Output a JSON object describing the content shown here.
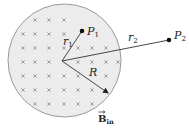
{
  "diagram": {
    "title": "",
    "colors": {
      "region_fill": "#ececec",
      "region_stroke": "#9a9a9a",
      "cross": "#8a8a8a",
      "line": "#333333",
      "point": "#111111"
    },
    "region": {
      "shape": "circle",
      "label": "uniform magnetic field into page",
      "cx": 64.5,
      "cy": 60.5,
      "r": 56.5
    },
    "field": {
      "symbol": "B",
      "subscript": "in",
      "vector": true,
      "marker": "×",
      "crosses": [
        [
          35,
          20
        ],
        [
          49,
          20
        ],
        [
          64,
          20
        ],
        [
          23,
          34
        ],
        [
          35,
          34
        ],
        [
          49,
          34
        ],
        [
          64,
          34
        ],
        [
          23,
          48
        ],
        [
          35,
          48
        ],
        [
          49,
          48
        ],
        [
          64,
          48
        ],
        [
          78,
          48
        ],
        [
          92,
          48
        ],
        [
          106,
          48
        ],
        [
          23,
          62
        ],
        [
          35,
          62
        ],
        [
          49,
          62
        ],
        [
          78,
          62
        ],
        [
          92,
          62
        ],
        [
          106,
          62
        ],
        [
          118,
          62
        ],
        [
          23,
          76
        ],
        [
          35,
          76
        ],
        [
          49,
          76
        ],
        [
          64,
          76
        ],
        [
          78,
          76
        ],
        [
          106,
          76
        ],
        [
          23,
          90
        ],
        [
          35,
          90
        ],
        [
          49,
          90
        ],
        [
          64,
          90
        ],
        [
          78,
          90
        ],
        [
          92,
          90
        ],
        [
          35,
          104
        ],
        [
          49,
          104
        ],
        [
          64,
          104
        ],
        [
          78,
          104
        ],
        [
          92,
          104
        ]
      ]
    },
    "points": [
      {
        "id": "P1",
        "label": "P",
        "subscript": "1",
        "x": 82,
        "y": 31,
        "label_x": 87,
        "label_y": 35
      },
      {
        "id": "P2",
        "label": "P",
        "subscript": "2",
        "x": 169,
        "y": 40,
        "label_x": 174,
        "label_y": 39
      }
    ],
    "segments": [
      {
        "id": "r1",
        "label": "r",
        "subscript": "1",
        "from": [
          62,
          61
        ],
        "to": [
          82,
          31
        ],
        "label_x": 63,
        "label_y": 45,
        "arrow": false
      },
      {
        "id": "r2",
        "label": "r",
        "subscript": "2",
        "from": [
          62,
          61
        ],
        "to": [
          169,
          40
        ],
        "label_x": 128,
        "label_y": 41,
        "arrow": false
      },
      {
        "id": "R",
        "label": "R",
        "subscript": "",
        "from": [
          62,
          61
        ],
        "to": [
          108,
          93
        ],
        "label_x": 89,
        "label_y": 76,
        "arrow": true
      }
    ],
    "field_label": {
      "text": "B",
      "subscript": "in",
      "x": 98,
      "y": 122
    }
  }
}
